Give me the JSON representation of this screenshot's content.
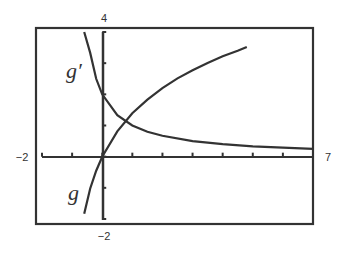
{
  "chart_data": {
    "type": "line",
    "title": "",
    "xlabel": "",
    "ylabel": "",
    "xlim": [
      -2,
      7
    ],
    "ylim": [
      -2,
      4
    ],
    "grid": false,
    "x_tick_step": 1,
    "y_tick_step": 1,
    "tick_labels": {
      "x_min": "−2",
      "x_max": "7",
      "y_max": "4",
      "y_min": "−2"
    },
    "series": [
      {
        "name": "g",
        "label": "g",
        "description": "increasing concave curve through the origin",
        "x": [
          -0.6,
          -0.4,
          -0.2,
          0,
          0.5,
          1,
          1.5,
          2,
          2.5,
          3,
          3.5,
          4,
          4.5,
          4.8
        ],
        "y": [
          -1.83,
          -1.02,
          -0.45,
          0,
          0.81,
          1.39,
          1.83,
          2.2,
          2.51,
          2.77,
          3.01,
          3.22,
          3.4,
          3.52
        ]
      },
      {
        "name": "g'",
        "label": "g′",
        "description": "decreasing derivative curve approaching 0",
        "x": [
          -0.6,
          -0.4,
          -0.2,
          0,
          0.5,
          1,
          1.5,
          2,
          3,
          4,
          5,
          6,
          7
        ],
        "y": [
          4.0,
          3.33,
          2.5,
          2.0,
          1.33,
          1.0,
          0.8,
          0.67,
          0.5,
          0.4,
          0.33,
          0.29,
          0.25
        ]
      }
    ],
    "annotations": [
      {
        "text": "g′",
        "x": -0.9,
        "y": 2.8
      },
      {
        "text": "g",
        "x": -0.9,
        "y": -1.3
      }
    ],
    "intersection": {
      "x": 0.6,
      "y": 1.1
    }
  },
  "colors": {
    "ink": "#333333",
    "background": "#ffffff"
  }
}
